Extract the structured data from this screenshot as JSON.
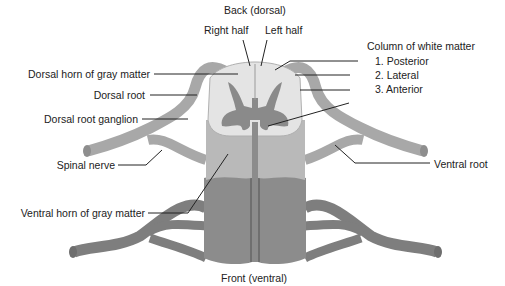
{
  "diagram": {
    "title_top": "Back (dorsal)",
    "title_bottom": "Front (ventral)",
    "labels": {
      "right_half": "Right half",
      "left_half": "Left half",
      "column_white_matter": "Column of white matter",
      "posterior": "1. Posterior",
      "lateral": "2. Lateral",
      "anterior": "3. Anterior",
      "dorsal_horn": "Dorsal horn of gray matter",
      "dorsal_root": "Dorsal root",
      "dorsal_root_ganglion": "Dorsal root ganglion",
      "spinal_nerve": "Spinal nerve",
      "ventral_horn": "Ventral horn of gray matter",
      "ventral_root": "Ventral root"
    },
    "colors": {
      "white_matter": "#e4e4e4",
      "cord_light": "#b9b9b9",
      "cord_dark": "#8c8c8c",
      "gray_matter": "#8a8a8a",
      "nerve": "#a8a8a8",
      "nerve_dark": "#7e7e7e",
      "leader_line": "#222222"
    }
  }
}
